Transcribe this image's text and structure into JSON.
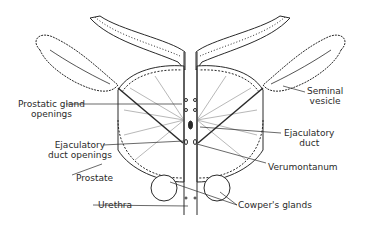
{
  "diagram": {
    "labels": {
      "prostatic_gland_openings": [
        "Prostatic gland",
        "openings"
      ],
      "ejaculatory_duct_openings": [
        "Ejaculatory",
        "duct openings"
      ],
      "prostate": "Prostate",
      "urethra": "Urethra",
      "seminal_vesicle": [
        "Seminal",
        "vesicle"
      ],
      "ejaculatory_duct": [
        "Ejaculatory",
        "duct"
      ],
      "verumontanum": "Verumontanum",
      "cowpers_glands": "Cowper's glands"
    },
    "colors": {
      "ink": "#2a2a2a",
      "background": "#ffffff"
    }
  }
}
